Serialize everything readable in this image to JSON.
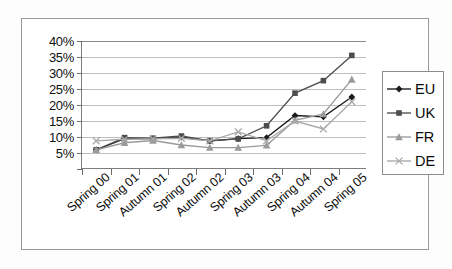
{
  "chart_data": {
    "type": "line",
    "title": "",
    "xlabel": "",
    "ylabel": "",
    "ylim": [
      0,
      40
    ],
    "ytick_labels": [
      "40%",
      "35%",
      "30%",
      "25%",
      "20%",
      "15%",
      "10%",
      "5%"
    ],
    "ytick_values": [
      40,
      35,
      30,
      25,
      20,
      15,
      10,
      5
    ],
    "grid": true,
    "legend_position": "right",
    "categories": [
      "Spring 00",
      "Spring 01",
      "Autumn 01",
      "Spring 02",
      "Autumn 02",
      "Spring 03",
      "Autumn 03",
      "Spring 04",
      "Autumn 04",
      "Spring 05"
    ],
    "series": [
      {
        "name": "EU",
        "marker": "diamond",
        "color": "#1a1a1a",
        "values": [
          6,
          9.5,
          9.5,
          10,
          8.8,
          9.5,
          9.8,
          16.7,
          16.3,
          22.5
        ]
      },
      {
        "name": "UK",
        "marker": "square",
        "color": "#4d4d4d",
        "values": [
          6,
          9.8,
          9.6,
          10.3,
          8.8,
          9.4,
          13.5,
          23.7,
          27.6,
          35.5
        ]
      },
      {
        "name": "FR",
        "marker": "triangle",
        "color": "#9a9a9a",
        "values": [
          6,
          8.2,
          8.9,
          7.5,
          6.7,
          6.7,
          7.4,
          15.2,
          17.2,
          28
        ]
      },
      {
        "name": "DE",
        "marker": "cross",
        "color": "#a8a8a8",
        "values": [
          8.8,
          9.3,
          9.4,
          9.6,
          8.8,
          11.6,
          8.8,
          15,
          12.5,
          21
        ]
      }
    ]
  },
  "legend": {
    "entries": [
      {
        "label": "EU"
      },
      {
        "label": "UK"
      },
      {
        "label": "FR"
      },
      {
        "label": "DE"
      }
    ]
  }
}
